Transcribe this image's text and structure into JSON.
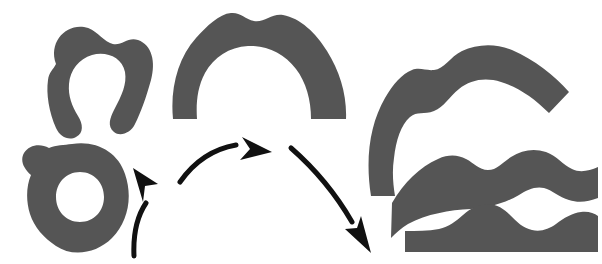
{
  "figure": {
    "width": 602,
    "height": 264,
    "background_color": "#ffffff",
    "shape_fill_color": "#555555",
    "arrow_color": "#111111",
    "arrow_stroke_width": 5
  },
  "groups": [
    {
      "id": "stage-1",
      "label": "initial-closed-shapes",
      "description": "left column: open horseshoe blob above, closed ring blob below",
      "shapes": [
        {
          "id": "horseshoe-blob",
          "name": "open-horseshoe-blob",
          "fill": "#555555",
          "path": "M 56 64 C 48 42 66 24 84 27 C 96 29 101 39 110 43 C 121 48 127 36 138 40 C 152 45 156 62 151 80 C 146 98 141 112 135 124 C 131 133 120 137 114 132 C 107 126 110 118 114 110 C 122 95 127 84 125 72 C 122 57 106 51 92 55 C 79 59 70 70 69 84 C 68 96 72 106 78 116 C 83 124 84 133 76 137 C 69 141 60 137 56 128 C 49 112 46 94 48 80 C 49 72 53 70 56 64 Z"
        },
        {
          "id": "ring-blob",
          "name": "closed-ring-blob",
          "fill": "#555555",
          "path": "M 72 144 C 96 140 118 152 125 174 C 133 197 128 222 112 238 C 96 254 72 257 56 246 C 44 238 34 227 30 214 C 26 201 26 187 31 175 C 23 168 20 160 24 153 C 29 145 40 143 49 148 C 56 145 64 145 72 144 Z M 80 172 C 66 172 56 183 56 197 C 56 211 66 222 80 222 C 94 222 104 211 104 197 C 104 183 94 172 80 172 Z"
        }
      ]
    },
    {
      "id": "stage-2",
      "label": "partially-opened-arch",
      "description": "center: thick arch / inverted-U band, opened out from the ring",
      "shapes": [
        {
          "id": "arch-band",
          "name": "opened-arch-band",
          "fill": "#555555",
          "path": "M 173 119 C 170 88 178 58 196 38 C 207 26 219 14 231 13 C 240 12 245 19 254 21 C 264 23 272 13 283 15 C 300 18 316 33 327 51 C 340 72 347 95 346 119 L 311 119 C 311 100 306 82 296 69 C 284 53 266 45 248 46 C 229 47 214 57 205 73 C 197 88 196 104 197 119 Z"
        }
      ]
    },
    {
      "id": "stage-3",
      "label": "unrolled-open-strips",
      "description": "right column: three progressively flattened strips, top hook, middle wavy band, bottom wavy slab",
      "shapes": [
        {
          "id": "hook-strip",
          "name": "unrolled-hook-strip",
          "fill": "#555555",
          "path": "M 371 196 C 365 158 370 124 385 98 C 393 84 402 74 412 70 C 420 67 426 71 434 70 C 444 69 450 57 462 51 C 477 44 495 43 512 50 C 535 60 554 75 569 92 L 549 113 C 534 98 518 87 501 82 C 485 77 470 80 459 89 C 449 97 444 107 434 111 C 424 115 417 111 410 117 C 401 125 396 140 394 158 C 392 171 393 184 395 196 Z"
        },
        {
          "id": "wavy-band",
          "name": "unrolled-wavy-band",
          "fill": "#555555",
          "path": "M 392 203 C 404 182 420 167 438 159 C 449 154 458 155 466 159 C 474 163 479 170 488 170 C 497 170 503 162 511 157 C 522 150 534 148 546 152 C 557 156 563 165 572 169 C 580 173 589 171 598 167 L 598 198 C 588 202 578 203 569 200 C 559 197 552 190 544 188 C 535 186 527 190 519 195 C 505 203 489 208 471 209 C 449 210 427 214 408 224 C 401 228 396 233 391 238 Z"
        },
        {
          "id": "wavy-slab",
          "name": "flattened-wavy-slab",
          "fill": "#555555",
          "path": "M 405 231 C 417 231 428 231 439 229 C 449 227 456 221 463 215 C 471 208 479 204 488 204 C 497 204 504 209 510 215 C 517 222 523 228 532 230 C 541 232 549 229 556 224 C 564 218 572 213 581 212 C 588 211 594 213 598 216 L 598 252 L 405 252 Z"
        }
      ]
    }
  ],
  "arrows": [
    {
      "id": "arrow-1",
      "name": "arrow-stage1-to-stage2",
      "color": "#111111",
      "direction": "up-right",
      "stroke_width": 5,
      "path": "M 134 256 C 133 235 136 218 146 203",
      "head_path": "M 133 168 L 158 184 L 145 186 L 143 202 Z"
    },
    {
      "id": "arrow-2",
      "name": "arrow-stage2-to-stage3-upper",
      "color": "#111111",
      "direction": "right",
      "stroke_width": 5,
      "path": "M 180 182 C 194 162 213 149 236 145",
      "head_path": "M 272 152 L 240 160 L 250 149 L 242 137 Z"
    },
    {
      "id": "arrow-3",
      "name": "arrow-stage2-to-stage3-lower",
      "color": "#111111",
      "direction": "down-right",
      "stroke_width": 5,
      "path": "M 291 148 C 315 169 337 196 352 222",
      "head_path": "M 371 253 L 345 229 L 357 228 L 361 216 Z"
    }
  ]
}
